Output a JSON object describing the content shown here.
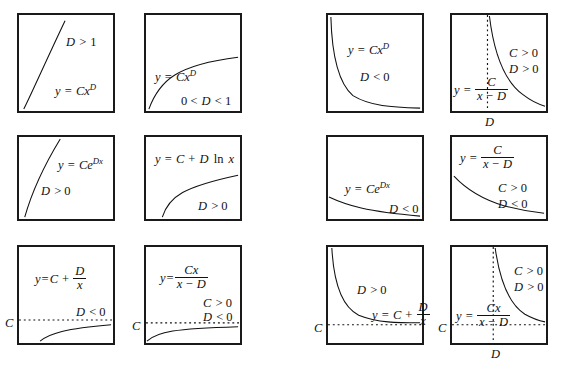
{
  "figure": {
    "layout": {
      "rows": 3,
      "columns": 4,
      "panel_count": 12
    },
    "colors": {
      "ink": "#111111",
      "border": "#1a1a1a",
      "background": "#ffffff",
      "curve": "#111111"
    }
  },
  "panels": [
    {
      "id": "panel-1",
      "row": 1,
      "col": 1,
      "equation_text": "y = Cx^D",
      "condition_text": "D > 1",
      "curve_shape": "power-law-superlinear",
      "has_dotted_horizontal": false,
      "has_dotted_vertical": false,
      "axis_labels": []
    },
    {
      "id": "panel-2",
      "row": 1,
      "col": 2,
      "equation_text": "y = Cx^D",
      "condition_text": "0 < D < 1",
      "curve_shape": "power-law-sublinear",
      "has_dotted_horizontal": false,
      "has_dotted_vertical": false,
      "axis_labels": []
    },
    {
      "id": "panel-3",
      "row": 1,
      "col": 3,
      "equation_text": "y = Cx^D",
      "condition_text": "D < 0",
      "curve_shape": "power-law-decay",
      "has_dotted_horizontal": false,
      "has_dotted_vertical": false,
      "axis_labels": []
    },
    {
      "id": "panel-4",
      "row": 1,
      "col": 4,
      "equation_text": "y = C/(x - D)",
      "condition_text": "C > 0  D > 0",
      "condition_lines": [
        "C > 0",
        "D > 0"
      ],
      "curve_shape": "hyperbola-right-branch",
      "has_dotted_horizontal": false,
      "has_dotted_vertical": true,
      "axis_labels": [
        {
          "text": "D",
          "position": "bottom"
        }
      ]
    },
    {
      "id": "panel-5",
      "row": 2,
      "col": 1,
      "equation_text": "y = Ce^Dx",
      "condition_text": "D > 0",
      "curve_shape": "exponential-growth",
      "has_dotted_horizontal": false,
      "has_dotted_vertical": false,
      "axis_labels": []
    },
    {
      "id": "panel-6",
      "row": 2,
      "col": 2,
      "equation_text": "y = C + D ln x",
      "condition_text": "D > 0",
      "curve_shape": "logarithmic-growth",
      "has_dotted_horizontal": false,
      "has_dotted_vertical": false,
      "axis_labels": []
    },
    {
      "id": "panel-7",
      "row": 2,
      "col": 3,
      "equation_text": "y = Ce^Dx",
      "condition_text": "D < 0",
      "curve_shape": "exponential-decay",
      "has_dotted_horizontal": false,
      "has_dotted_vertical": false,
      "axis_labels": []
    },
    {
      "id": "panel-8",
      "row": 2,
      "col": 4,
      "equation_text": "y = C/(x - D)",
      "condition_text": "C > 0  D < 0",
      "condition_lines": [
        "C > 0",
        "D < 0"
      ],
      "curve_shape": "hyperbola-decay",
      "has_dotted_horizontal": false,
      "has_dotted_vertical": false,
      "axis_labels": []
    },
    {
      "id": "panel-9",
      "row": 3,
      "col": 1,
      "equation_text": "y = C + D/x",
      "condition_text": "D < 0",
      "curve_shape": "rising-to-asymptote-from-below",
      "has_dotted_horizontal": true,
      "has_dotted_vertical": false,
      "axis_labels": [
        {
          "text": "C",
          "position": "left"
        }
      ]
    },
    {
      "id": "panel-10",
      "row": 3,
      "col": 2,
      "equation_text": "y = Cx/(x - D)",
      "condition_text": "C > 0  D < 0",
      "condition_lines": [
        "C > 0",
        "D < 0"
      ],
      "curve_shape": "rising-to-asymptote-from-below",
      "has_dotted_horizontal": true,
      "has_dotted_vertical": false,
      "axis_labels": [
        {
          "text": "C",
          "position": "left"
        }
      ]
    },
    {
      "id": "panel-11",
      "row": 3,
      "col": 3,
      "equation_text": "y = C + D/x",
      "condition_text": "D > 0",
      "curve_shape": "falling-to-asymptote-from-above",
      "has_dotted_horizontal": true,
      "has_dotted_vertical": false,
      "axis_labels": [
        {
          "text": "C",
          "position": "left"
        }
      ]
    },
    {
      "id": "panel-12",
      "row": 3,
      "col": 4,
      "equation_text": "y = Cx/(x - D)",
      "condition_text": "C > 0  D > 0",
      "condition_lines": [
        "C > 0",
        "D > 0"
      ],
      "curve_shape": "hyperbola-two-branch-with-asymptotes",
      "has_dotted_horizontal": true,
      "has_dotted_vertical": true,
      "axis_labels": [
        {
          "text": "C",
          "position": "left"
        },
        {
          "text": "D",
          "position": "bottom"
        }
      ]
    }
  ],
  "symbols": {
    "y": "y",
    "equals": "=",
    "C": "C",
    "D": "D",
    "x": "x",
    "e": "e",
    "ln": "ln",
    "plus": "+",
    "minus": "−",
    "gt": ">",
    "lt": "<",
    "one": "1",
    "zero": "0"
  }
}
